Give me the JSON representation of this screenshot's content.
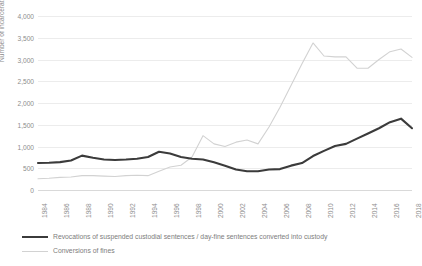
{
  "chart_data": {
    "type": "line",
    "title": "",
    "xlabel": "",
    "ylabel": "Number of incarcerations",
    "x": [
      1984,
      1985,
      1986,
      1987,
      1988,
      1989,
      1990,
      1991,
      1992,
      1993,
      1994,
      1995,
      1996,
      1997,
      1998,
      1999,
      2000,
      2001,
      2002,
      2003,
      2004,
      2005,
      2006,
      2007,
      2008,
      2009,
      2010,
      2011,
      2012,
      2013,
      2014,
      2015,
      2016,
      2017,
      2018
    ],
    "xticks": [
      "1984",
      "1986",
      "1988",
      "1990",
      "1992",
      "1994",
      "1996",
      "1998",
      "2000",
      "2002",
      "2004",
      "2006",
      "2008",
      "2010",
      "2012",
      "2014",
      "2016",
      "2018"
    ],
    "yticks": [
      "0",
      "500",
      "1,000",
      "1,500",
      "2,000",
      "2,500",
      "3,000",
      "3,500",
      "4,000"
    ],
    "ylim": [
      0,
      4000
    ],
    "ytick_values": [
      0,
      500,
      1000,
      1500,
      2000,
      2500,
      3000,
      3500,
      4000
    ],
    "grid": true,
    "legend_position": "bottom-left",
    "series": [
      {
        "name": "Revocations of suspended custodial sentences / day-fine sentences converted into custody",
        "color": "#3b3b3b",
        "width": 2.1,
        "style": "solid",
        "values": [
          620,
          625,
          640,
          680,
          790,
          740,
          700,
          690,
          700,
          720,
          760,
          880,
          840,
          760,
          720,
          700,
          640,
          560,
          470,
          430,
          430,
          470,
          480,
          560,
          620,
          780,
          900,
          1010,
          1060,
          1180,
          1300,
          1420,
          1560,
          1640,
          1420
        ]
      },
      {
        "name": "Conversions of fines",
        "color": "#d2d2d2",
        "width": 1.1,
        "style": "solid",
        "values": [
          260,
          270,
          290,
          300,
          330,
          330,
          320,
          310,
          330,
          340,
          330,
          430,
          530,
          570,
          760,
          1250,
          1060,
          1000,
          1100,
          1150,
          1060,
          1450,
          1900,
          2400,
          2900,
          3380,
          3080,
          3060,
          3060,
          2800,
          2800,
          3000,
          3180,
          3240,
          3050
        ]
      }
    ],
    "legend": [
      {
        "label": "Revocations of suspended custodial sentences / day-fine sentences converted into custody",
        "swatch": "dark-solid-line"
      },
      {
        "label": "Conversions of fines",
        "swatch": "light-solid-line"
      }
    ]
  }
}
